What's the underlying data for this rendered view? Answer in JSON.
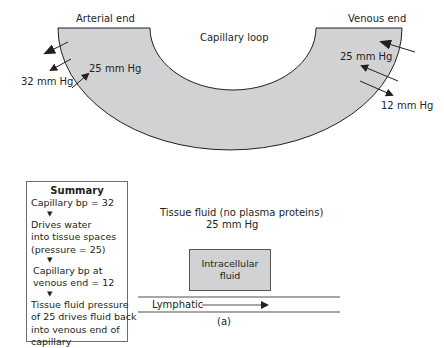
{
  "labels": {
    "arterial_end": "Arterial end",
    "venous_end": "Venous end",
    "capillary_loop": "Capillary loop",
    "arterial_inside_pressure": "25 mm Hg",
    "arterial_outside_pressure": "32 mm Hg",
    "venous_inside_pressure": "25 mm Hg",
    "venous_outside_pressure": "12 mm Hg",
    "tissue_fluid": "Tissue fluid (no plasma proteins)",
    "tissue_fluid_pressure": "25 mm Hg",
    "intracellular_fluid_line1": "Intracellular",
    "intracellular_fluid_line2": "fluid",
    "lymphatic": "Lymphatic",
    "caption": "(a)"
  },
  "summary": {
    "title": "Summary",
    "steps": [
      [
        "Capillary bp = 32"
      ],
      [
        "Drives water",
        "into tissue spaces",
        "(pressure = 25)"
      ],
      [
        "Capillary bp at",
        "venous end = 12"
      ],
      [
        "Tissue fluid pressure",
        "of 25 drives fluid back",
        "into venous end of",
        "capillary"
      ]
    ],
    "arrow_glyph": "▼"
  },
  "colors": {
    "capillary_fill": "#d1d2d4",
    "stroke": "#231f20",
    "box_border": "#6d6e71"
  }
}
